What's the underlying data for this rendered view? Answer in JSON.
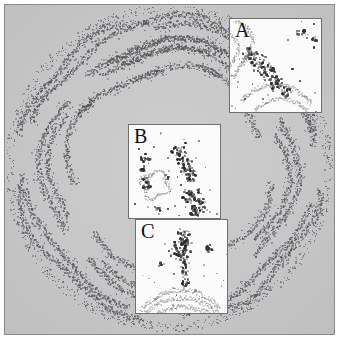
{
  "figure": {
    "type": "autoradiograph-micrograph",
    "background_color": "#c9c9c9",
    "frame_color": "#8a8a8a",
    "page_background": "#ffffff",
    "width": 339,
    "height": 339
  },
  "main_panel": {
    "name": "overview-section",
    "shape": "circular tissue section",
    "label_pattern": "stippled silver-grain bands forming concentric folded laminae",
    "grain_color": "#50505a",
    "field_color": "#c9c9c9"
  },
  "insets": [
    {
      "id": "a",
      "label": "A",
      "x": 224,
      "y": 13,
      "width": 93,
      "height": 95,
      "background_color": "#fbfbfb",
      "border_color": "#6f6f6f",
      "grain_color": "#2c2c30"
    },
    {
      "id": "b",
      "label": "B",
      "x": 123,
      "y": 119,
      "width": 93,
      "height": 95,
      "background_color": "#fbfbfb",
      "border_color": "#6f6f6f",
      "grain_color": "#2c2c30"
    },
    {
      "id": "c",
      "label": "C",
      "x": 130,
      "y": 214,
      "width": 93,
      "height": 95,
      "background_color": "#fbfbfb",
      "border_color": "#6f6f6f",
      "grain_color": "#2c2c30"
    }
  ],
  "chart_data": {
    "type": "scatter",
    "title": "",
    "xlabel": "",
    "ylabel": "",
    "grid": false,
    "legend": "none",
    "series": [
      {
        "name": "overview-bands",
        "n_points": 4200,
        "color": "#50505a",
        "note": "grains distributed along folded laminar bands within an annulus"
      },
      {
        "name": "inset-A-grains",
        "n_points": 190,
        "color": "#2c2c30"
      },
      {
        "name": "inset-B-grains",
        "n_points": 240,
        "color": "#2c2c30"
      },
      {
        "name": "inset-C-grains",
        "n_points": 215,
        "color": "#2c2c30"
      }
    ]
  }
}
